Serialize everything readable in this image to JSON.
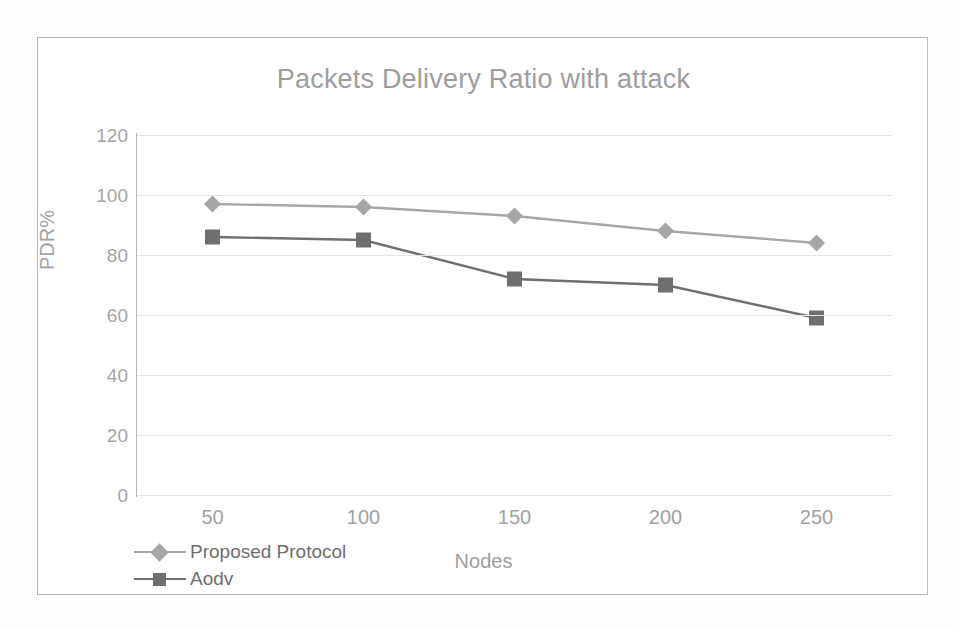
{
  "chart_data": {
    "type": "line",
    "title": "Packets Delivery Ratio with attack",
    "xlabel": "Nodes",
    "ylabel": "PDR%",
    "categories": [
      "50",
      "100",
      "150",
      "200",
      "250"
    ],
    "x": [
      50,
      100,
      150,
      200,
      250
    ],
    "series": [
      {
        "name": "Proposed Protocol",
        "values": [
          97,
          96,
          93,
          88,
          84
        ],
        "color": "#a6a6a6",
        "marker": "diamond"
      },
      {
        "name": "Aodv",
        "values": [
          86,
          85,
          72,
          70,
          59
        ],
        "color": "#6f6f6f",
        "marker": "square"
      }
    ],
    "ylim": [
      0,
      120
    ],
    "yticks": [
      0,
      20,
      40,
      60,
      80,
      100,
      120
    ],
    "ytick_labels": [
      "0",
      "20",
      "40",
      "60",
      "80",
      "100",
      "120"
    ],
    "grid": true,
    "grid_axis": "y",
    "legend_position": "bottom-left",
    "border_color": "#b9b9b9",
    "gridline_color": "#e4e4e4",
    "axis_color": "#b7b7b7",
    "title_color": "#9d9d9d",
    "tick_label_color": "#a4a4a4"
  },
  "legend": {
    "items": [
      {
        "label": "Proposed Protocol"
      },
      {
        "label": "Aodv"
      }
    ]
  }
}
